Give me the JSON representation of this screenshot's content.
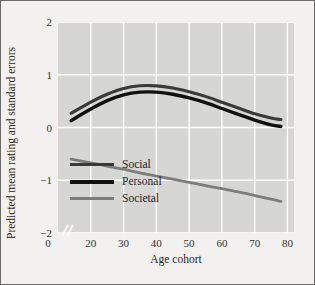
{
  "figure": {
    "background_color": "#f2f1ef",
    "plot_background_color": "#d6d6d4",
    "grid_color": "#ffffff",
    "border_color": "#6a6a68"
  },
  "chart_data": {
    "type": "line",
    "title": "",
    "xlabel": "Age cohort",
    "ylabel": "Predicted mean rating and standard errors",
    "xlim": [
      10,
      82
    ],
    "ylim": [
      -2,
      2
    ],
    "xticks": [
      0,
      20,
      30,
      40,
      50,
      60,
      70,
      80
    ],
    "xtick_labels": [
      "0",
      "20",
      "30",
      "40",
      "50",
      "60",
      "70",
      "80"
    ],
    "yticks": [
      2,
      1,
      0,
      -1,
      -2
    ],
    "ytick_labels": [
      "2",
      "1",
      "0",
      "−1",
      "−2"
    ],
    "grid": true,
    "axis_break": true,
    "legend_position": "lower-left-inside",
    "x": [
      14,
      20,
      25,
      30,
      35,
      40,
      45,
      50,
      55,
      60,
      65,
      70,
      75,
      78
    ],
    "series": [
      {
        "name": "Social",
        "color": "#3b3a38",
        "line_width": 3.1,
        "values": [
          0.27,
          0.48,
          0.63,
          0.74,
          0.79,
          0.79,
          0.75,
          0.68,
          0.59,
          0.48,
          0.37,
          0.26,
          0.18,
          0.15
        ]
      },
      {
        "name": "Personal",
        "color": "#111110",
        "line_width": 3.4,
        "values": [
          0.13,
          0.35,
          0.51,
          0.62,
          0.67,
          0.67,
          0.63,
          0.56,
          0.47,
          0.36,
          0.25,
          0.14,
          0.05,
          0.02
        ]
      },
      {
        "name": "Societal",
        "color": "#7d7d7b",
        "line_width": 2.8,
        "values": [
          -0.6,
          -0.67,
          -0.73,
          -0.79,
          -0.86,
          -0.92,
          -0.98,
          -1.04,
          -1.1,
          -1.16,
          -1.22,
          -1.29,
          -1.36,
          -1.4
        ]
      }
    ]
  },
  "legend": {
    "items": [
      {
        "label": "Social",
        "color": "#3b3a38",
        "thickness": 3
      },
      {
        "label": "Personal",
        "color": "#111110",
        "thickness": 4
      },
      {
        "label": "Societal",
        "color": "#7d7d7b",
        "thickness": 3
      }
    ]
  }
}
